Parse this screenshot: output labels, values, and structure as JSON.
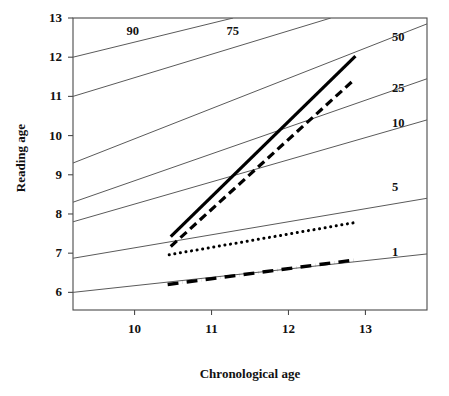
{
  "chart_data": {
    "type": "line",
    "title": "",
    "xlabel": "Chronological age",
    "ylabel": "Reading age",
    "xlim": [
      9.2,
      13.8
    ],
    "ylim": [
      5.55,
      13.0
    ],
    "xticks": [
      10,
      11,
      12,
      13
    ],
    "xtick_labels": [
      "10",
      "11",
      "12",
      "13"
    ],
    "yticks": [
      6,
      7,
      8,
      9,
      10,
      11,
      12,
      13
    ],
    "ytick_labels": [
      "6",
      "7",
      "8",
      "9",
      "10",
      "11",
      "12",
      "13"
    ],
    "grid": false,
    "legend": "none",
    "reference_lines": [
      {
        "name": "percentile-90",
        "label": "90",
        "label_position": "inside-top-left",
        "label_x": 10.0,
        "label_y": 12.65,
        "points": [
          [
            9.2,
            12.0
          ],
          [
            11.28,
            13.0
          ]
        ]
      },
      {
        "name": "percentile-75",
        "label": "75",
        "label_position": "inside-top-left",
        "label_x": 11.3,
        "label_y": 12.65,
        "points": [
          [
            9.2,
            11.0
          ],
          [
            12.55,
            13.0
          ]
        ]
      },
      {
        "name": "percentile-50",
        "label": "50",
        "label_position": "right",
        "label_x": 13.45,
        "label_y": 12.5,
        "points": [
          [
            9.2,
            9.3
          ],
          [
            13.8,
            12.85
          ]
        ]
      },
      {
        "name": "percentile-25",
        "label": "25",
        "label_position": "right",
        "label_x": 13.45,
        "label_y": 11.2,
        "points": [
          [
            9.2,
            8.3
          ],
          [
            13.8,
            11.45
          ]
        ]
      },
      {
        "name": "percentile-10",
        "label": "10",
        "label_position": "right",
        "label_x": 13.45,
        "label_y": 10.3,
        "points": [
          [
            9.2,
            7.8
          ],
          [
            13.8,
            10.4
          ]
        ]
      },
      {
        "name": "percentile-5",
        "label": "5",
        "label_position": "right",
        "label_x": 13.45,
        "label_y": 8.65,
        "points": [
          [
            9.2,
            6.87
          ],
          [
            13.8,
            8.4
          ]
        ]
      },
      {
        "name": "percentile-1",
        "label": "1",
        "label_position": "right",
        "label_x": 13.45,
        "label_y": 7.0,
        "points": [
          [
            9.2,
            6.0
          ],
          [
            13.8,
            6.98
          ]
        ]
      }
    ],
    "series": [
      {
        "name": "solid-line",
        "style": "solid",
        "color": "#000000",
        "width": 3.2,
        "points": [
          [
            10.47,
            7.42
          ],
          [
            12.87,
            12.03
          ]
        ]
      },
      {
        "name": "dashed-line",
        "style": "dashed",
        "color": "#000000",
        "width": 3.2,
        "points": [
          [
            10.47,
            7.17
          ],
          [
            12.85,
            11.42
          ]
        ]
      },
      {
        "name": "dotted-line",
        "style": "dotted",
        "color": "#000000",
        "width": 3.0,
        "points": [
          [
            10.45,
            6.96
          ],
          [
            12.86,
            7.78
          ]
        ]
      },
      {
        "name": "dash-dot-line",
        "style": "dashdot",
        "color": "#000000",
        "width": 3.4,
        "points": [
          [
            10.43,
            6.2
          ],
          [
            12.87,
            6.83
          ]
        ]
      }
    ]
  },
  "axes": {
    "x_title": "Chronological age",
    "y_title": "Reading age"
  },
  "colors": {
    "background": "#ffffff",
    "axis": "#4a4a4a",
    "reference_line": "#5a5a5a",
    "data_line": "#000000"
  }
}
